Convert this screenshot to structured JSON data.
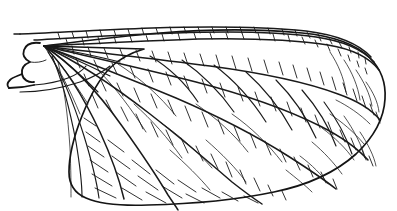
{
  "figure": {
    "kind": "scientific-line-drawing",
    "orientation": "base-at-left, apex-at-right",
    "canvas": {
      "width": 397,
      "height": 211
    },
    "style": {
      "background_color": "#ffffff",
      "vein_color": "#1a1a1a",
      "outline_color": "#141414",
      "fill_color": "#ffffff",
      "line_weight_outline": 1.7,
      "line_weight_major_vein": 1.5,
      "line_weight_cross_vein": 0.9
    },
    "caption": "",
    "labels": []
  },
  "wing": {
    "outline_path": "M 24 72 L 96 66 L 150 62 L 210 56 L 268 50 L 312 47 L 342 49 L 364 58 L 376 74 L 380 96 L 374 122 L 356 146 L 330 166 L 296 181 L 252 192 L 208 198 L 166 201 L 130 202 L 104 200 L 86 193 L 76 180 L 72 162 L 74 140 L 78 120 L 82 102 L 84 88 L 80 80 L 60 76 Z",
    "costal_margin": "M 38 31 L 92 30 L 150 30 L 214 31 L 272 34 L 316 39 L 348 47 L 368 60 L 378 78 L 381 98",
    "apex_margin": "M 381 98 L 376 120 L 362 142 L 340 161 L 310 176 L 274 187",
    "hind_margin": "M 274 187 L 230 196 L 186 201 L 146 203 L 114 202 L 92 197 L 78 186 L 72 168",
    "base_point": {
      "x": 44,
      "y": 46
    },
    "regions": [
      "costal-field",
      "subcostal-field",
      "radial-field",
      "median-field",
      "cubital-field",
      "anal-field",
      "apical-field"
    ]
  },
  "chart_data": {
    "type": "line",
    "xlabel": "",
    "ylabel": "",
    "xlim": [
      0,
      397
    ],
    "ylim": [
      0,
      211
    ],
    "grid": false,
    "legend": "none",
    "series": [
      {
        "name": "costal-margin",
        "kind": "outline"
      },
      {
        "name": "hind-margin",
        "kind": "outline"
      },
      {
        "name": "longitudinal-veins",
        "kind": "major-vein",
        "count": 11
      },
      {
        "name": "cross-veins",
        "kind": "cross-vein",
        "count": 240
      }
    ]
  }
}
